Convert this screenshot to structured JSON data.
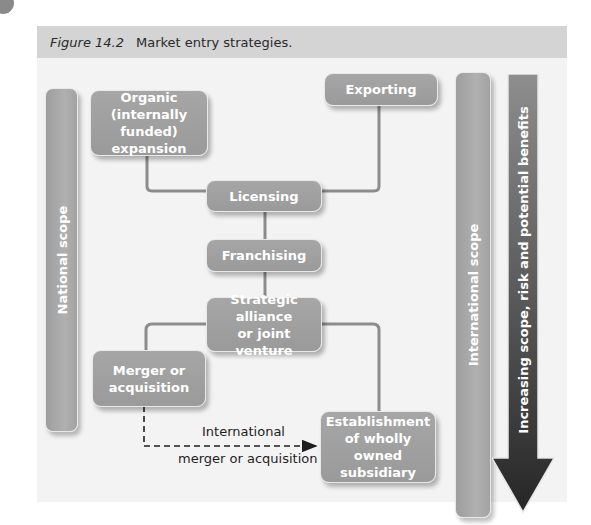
{
  "caption": {
    "figure_number": "Figure 14.2",
    "title": "Market entry strategies."
  },
  "side_bars": {
    "national": "National scope",
    "international": "International scope"
  },
  "big_arrow": {
    "label": "Increasing scope, risk and potential benefits",
    "direction": "down"
  },
  "nodes": {
    "organic": "Organic (internally funded) expansion",
    "organic_lines": [
      "Organic",
      "(internally funded)",
      "expansion"
    ],
    "exporting": "Exporting",
    "licensing": "Licensing",
    "franchising": "Franchising",
    "alliance_lines": [
      "Strategic alliance",
      "or joint venture"
    ],
    "merger_lines": [
      "Merger or",
      "acquisition"
    ],
    "subsidiary_lines": [
      "Establishment",
      "of wholly owned",
      "subsidiary"
    ]
  },
  "edges": [
    {
      "from": "Organic (internally funded) expansion",
      "to": "Licensing",
      "style": "solid"
    },
    {
      "from": "Exporting",
      "to": "Licensing",
      "style": "solid"
    },
    {
      "from": "Licensing",
      "to": "Franchising",
      "style": "solid"
    },
    {
      "from": "Franchising",
      "to": "Strategic alliance or joint venture",
      "style": "solid"
    },
    {
      "from": "Strategic alliance or joint venture",
      "to": "Merger or acquisition",
      "style": "solid"
    },
    {
      "from": "Strategic alliance or joint venture",
      "to": "Establishment of wholly owned subsidiary",
      "style": "solid"
    },
    {
      "from": "Merger or acquisition",
      "to": "Establishment of wholly owned subsidiary",
      "style": "dashed-arrow",
      "label": "International merger or acquisition"
    }
  ],
  "dashed_arrow_label": {
    "line1": "International",
    "line2": "merger or acquisition"
  },
  "colors": {
    "box_fill": "#a3a3a3",
    "box_border": "#e8e8e8",
    "panel_bg": "#f3f3f3",
    "caption_bg": "#d4d4d4",
    "connector": "#8c8c8c",
    "arrow_dark": "#2e2e2e"
  }
}
